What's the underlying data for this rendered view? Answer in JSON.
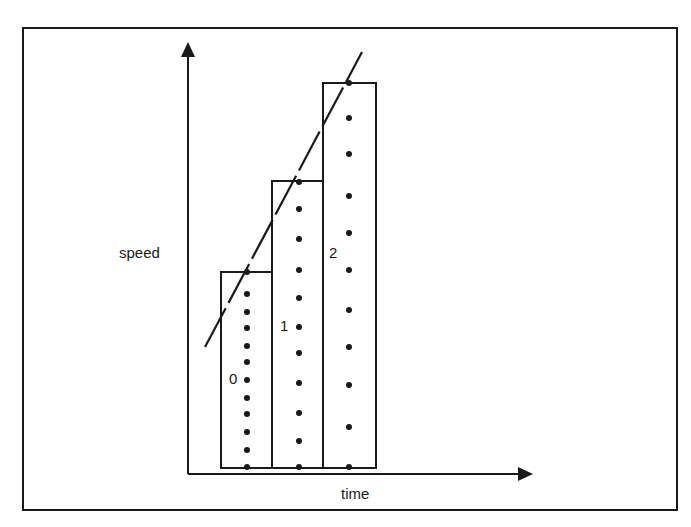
{
  "diagram": {
    "y_axis_label": "speed",
    "x_axis_label": "time",
    "colors": {
      "ink": "#1a1a1a",
      "background": "#ffffff"
    },
    "bars": [
      {
        "label": "0",
        "x": 221,
        "width": 51,
        "top": 272,
        "bottom": 468,
        "label_pos": [
          229,
          371
        ],
        "dots_x": 247,
        "dots_y": [
          272,
          294,
          312,
          328,
          346,
          362,
          380,
          398,
          414,
          432,
          450,
          467
        ]
      },
      {
        "label": "1",
        "x": 272,
        "width": 51,
        "top": 181,
        "bottom": 468,
        "label_pos": [
          280,
          318
        ],
        "dots_x": 299,
        "dots_y": [
          182,
          209,
          239,
          270,
          298,
          327,
          353,
          383,
          413,
          441,
          467
        ]
      },
      {
        "label": "2",
        "x": 323,
        "width": 53,
        "top": 83,
        "bottom": 468,
        "label_pos": [
          329,
          245
        ],
        "dots_x": 349,
        "dots_y": [
          83,
          118,
          154,
          196,
          233,
          270,
          310,
          347,
          385,
          427,
          467
        ]
      }
    ],
    "trend_line": {
      "style": "dashed",
      "from": [
        205,
        347
      ],
      "to": [
        362,
        52
      ]
    },
    "axes": {
      "y_axis": {
        "x": 188,
        "from_y": 474,
        "to_y": 42
      },
      "x_axis": {
        "y": 474,
        "from_x": 188,
        "to_x": 533
      }
    }
  }
}
